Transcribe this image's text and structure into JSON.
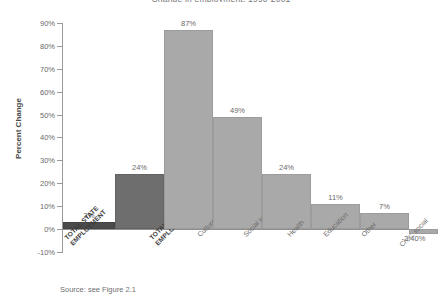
{
  "chart_data": {
    "type": "bar",
    "title": "Change in employment, 1990-2001",
    "xlabel": "",
    "ylabel": "Percent Change",
    "ylim": [
      -10,
      90
    ],
    "ytick_labels": [
      "90%",
      "80%",
      "70%",
      "60%",
      "50%",
      "40%",
      "30%",
      "20%",
      "10%",
      "0%",
      "-10%"
    ],
    "ytick_values": [
      90,
      80,
      70,
      60,
      50,
      40,
      30,
      20,
      10,
      0,
      -10
    ],
    "grid": false,
    "legend": "none",
    "categories": [
      "TOTAL STATE EMPLOYMENT",
      "TOTAL NONPROFIT EMPLOYMENT",
      "Culture, recreation",
      "Social services",
      "Health",
      "Education",
      "Other",
      "Civic, social"
    ],
    "values": [
      3,
      24,
      87,
      49,
      24,
      11,
      7,
      -2.4
    ],
    "value_labels": [
      "3%",
      "24%",
      "87%",
      "49%",
      "24%",
      "11%",
      "7%",
      "-2.40%"
    ],
    "bar_styles": [
      "dark",
      "mid",
      "light",
      "light",
      "light",
      "light",
      "light",
      "light"
    ],
    "source": "Source: see Figure 2.1"
  },
  "colors": {
    "bar_light": "#a9a9a9",
    "bar_mid": "#6e6e6e",
    "bar_dark": "#4b4b4b",
    "axis": "#8f8f8f",
    "text": "#6a6a6a"
  }
}
